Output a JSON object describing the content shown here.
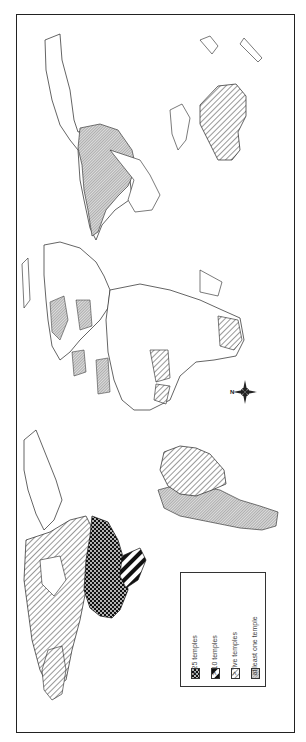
{
  "map": {
    "title": "World map of temple distribution",
    "orientation": "rotated 90 degrees clockwise (north points left)",
    "colors": {
      "border": "#222222",
      "ink": "#333333",
      "background": "#ffffff"
    }
  },
  "compass": {
    "label": "N",
    "direction": "left"
  },
  "legend": {
    "items": [
      {
        "label": "> 25 temples",
        "pattern": "crosshatch-dots",
        "regions": [
          "United States"
        ]
      },
      {
        "label": "> 10 temples",
        "pattern": "bold-diagonal",
        "regions": [
          "Mexico"
        ]
      },
      {
        "label": "> five temples",
        "pattern": "diagonal-hatch",
        "regions": [
          "Canada",
          "Alaska",
          "Brazil",
          "Australia"
        ]
      },
      {
        "label": "at least one temple",
        "pattern": "fine-hatch",
        "regions": [
          "Russia/Asia",
          "Argentina",
          "Chile",
          "Peru",
          "Bolivia",
          "Europe (several)",
          "Africa (several)"
        ]
      }
    ]
  }
}
